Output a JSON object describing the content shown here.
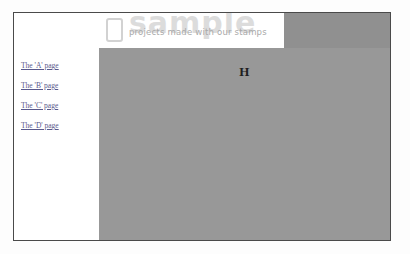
{
  "page": {
    "background_color": "#fdfdfd",
    "frame_border_color": "#4a4a4a"
  },
  "banner": {
    "logo_icon": "rounded-card-outline-icon",
    "watermark_text": "sample",
    "watermark_color": "#dcdcdc",
    "tagline": "projects made with our stamps",
    "tagline_color": "#a9a9a9",
    "right_block_color": "#909090"
  },
  "sidebar": {
    "heading": "Links",
    "background_color": "#ffffff",
    "link_color": "#5a5a8c",
    "items": [
      {
        "label": "The 'A' page"
      },
      {
        "label": "The 'B' page"
      },
      {
        "label": "The 'C' page"
      },
      {
        "label": "The 'D' page"
      }
    ]
  },
  "content": {
    "background_color": "#989898",
    "letter": "H"
  }
}
